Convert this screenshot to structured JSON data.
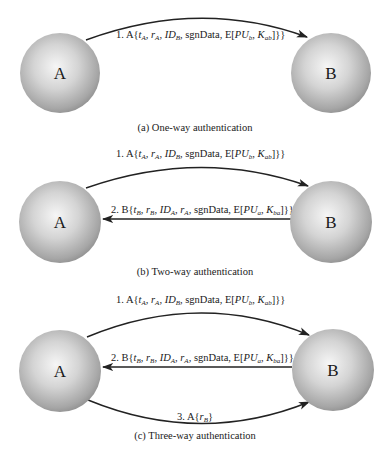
{
  "panels": [
    {
      "id": "a",
      "caption": "(a) One-way authentication",
      "nodes": {
        "left": "A",
        "right": "B"
      },
      "messages": [
        {
          "step": "1.",
          "sender": "A",
          "direction": "A→B",
          "text": "1. A{tA, rA, IDB, sgnData, E[PUb, Kab]}"
        }
      ]
    },
    {
      "id": "b",
      "caption": "(b) Two-way authentication",
      "nodes": {
        "left": "A",
        "right": "B"
      },
      "messages": [
        {
          "step": "1.",
          "sender": "A",
          "direction": "A→B",
          "text": "1. A{tA, rA, IDB, sgnData, E[PUb, Kab]}"
        },
        {
          "step": "2.",
          "sender": "B",
          "direction": "B→A",
          "text": "2. B{tB, rB, IDA, rA, sgnData, E[PUa, Kba]}"
        }
      ]
    },
    {
      "id": "c",
      "caption": "(c) Three-way authentication",
      "nodes": {
        "left": "A",
        "right": "B"
      },
      "messages": [
        {
          "step": "1.",
          "sender": "A",
          "direction": "A→B",
          "text": "1. A{tA, rA, IDB, sgnData, E[PUb, Kab]}"
        },
        {
          "step": "2.",
          "sender": "B",
          "direction": "B→A",
          "text": "2. B{tB, rB, IDA, rA, sgnData, E[PUa, Kba]}"
        },
        {
          "step": "3.",
          "sender": "A",
          "direction": "A→B",
          "text": "3. A{rB}"
        }
      ]
    }
  ],
  "tokens": {
    "step1": "1.",
    "step2": "2.",
    "step3": "3.",
    "A": "A",
    "B": "B",
    "open": "{",
    "close": "}}",
    "close_single": "}",
    "t": "t",
    "r": "r",
    "ID": "ID",
    "sub_A": "A",
    "sub_B": "B",
    "comma": ", ",
    "sgnData": "sgnData",
    "E_open": "E[",
    "PU": "PU",
    "K": "K",
    "sub_a": "a",
    "sub_b": "b",
    "sub_ab": "ab",
    "sub_ba": "ba"
  },
  "colors": {
    "sphere_light": "#f4f4f4",
    "sphere_mid": "#bdbdbd",
    "sphere_dark": "#8a8a8a",
    "stroke": "#222222"
  }
}
